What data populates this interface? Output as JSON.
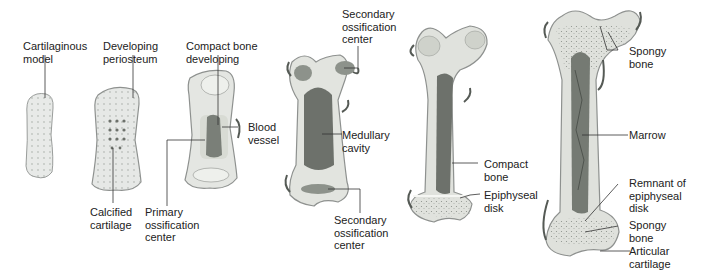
{
  "diagram": {
    "colors": {
      "cartilage": "#e6e8e6",
      "cartilage_edge": "#9a9d9b",
      "bone": "#d9dcd4",
      "marrow": "#6d716b",
      "vessel": "#555a55",
      "leader": "#333333",
      "text": "#222222"
    },
    "labels": {
      "cartilaginous_model": "Cartilaginous\nmodel",
      "developing_periosteum": "Developing\nperiosteum",
      "calcified_cartilage": "Calcified\ncartilage",
      "compact_bone_developing": "Compact bone\ndeveloping",
      "blood_vessel": "Blood\nvessel",
      "primary_ossification_center": "Primary\nossification\ncenter",
      "secondary_ossification_center_top": "Secondary\nossification\ncenter",
      "medullary_cavity": "Medullary\ncavity",
      "secondary_ossification_center_bottom": "Secondary\nossification\ncenter",
      "compact_bone": "Compact\nbone",
      "epiphyseal_disk": "Epiphyseal\ndisk",
      "spongy_bone_top": "Spongy\nbone",
      "marrow": "Marrow",
      "remnant_of_epiphyseal_disk": "Remnant of\nepiphyseal\ndisk",
      "spongy_bone_bottom": "Spongy\nbone",
      "articular_cartilage": "Articular\ncartilage"
    }
  }
}
